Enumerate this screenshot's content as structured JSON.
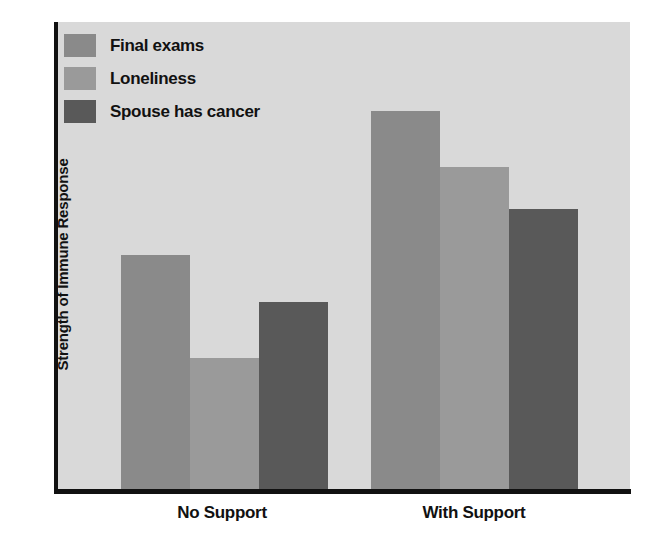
{
  "chart_data": {
    "type": "bar",
    "title": "",
    "subtitle": "",
    "xlabel": "",
    "ylabel": "Strength of Immune Response",
    "categories": [
      "No Support",
      "With Support"
    ],
    "series": [
      {
        "name": "Final exams",
        "color": "#8a8a8a",
        "values": [
          50,
          81
        ]
      },
      {
        "name": "Loneliness",
        "color": "#9a9a9a",
        "values": [
          28,
          69
        ]
      },
      {
        "name": "Spouse has cancer",
        "color": "#595959",
        "values": [
          40,
          60
        ]
      }
    ],
    "ylim": [
      0,
      100
    ],
    "yticks": [],
    "ytick_labels": [],
    "grid": false,
    "legend_position": "top-left",
    "bar_gap_within_group": 0,
    "annotations": []
  },
  "axes": {
    "y_title": "Strength of Immune Response",
    "x_categories": [
      {
        "label": "No Support"
      },
      {
        "label": "With Support"
      }
    ]
  },
  "legend": {
    "items": [
      {
        "label": "Final exams",
        "color": "#8a8a8a"
      },
      {
        "label": "Loneliness",
        "color": "#9a9a9a"
      },
      {
        "label": "Spouse has cancer",
        "color": "#595959"
      }
    ]
  },
  "colors": {
    "plot_background": "#d9d9d9",
    "page_background": "#ffffff",
    "axis": "#111111",
    "text": "#111111",
    "series_final_exams": "#8a8a8a",
    "series_loneliness": "#9a9a9a",
    "series_spouse_has_cancer": "#595959"
  }
}
